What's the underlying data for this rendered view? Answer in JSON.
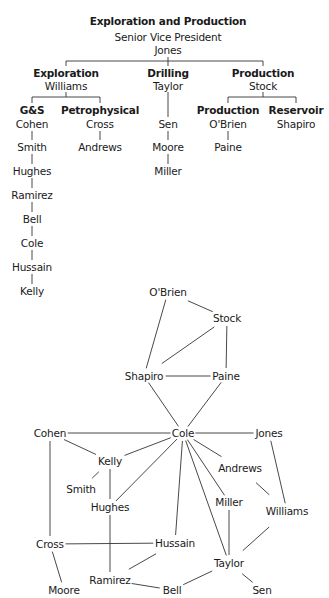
{
  "org_chart": {
    "title": "Exploration and Production",
    "subtitle": "Senior Vice President",
    "head": "Jones",
    "divisions": [
      {
        "name": "Exploration",
        "leader": "Williams",
        "units": [
          {
            "name": "G&S",
            "leader": "Cohen",
            "members": [
              "Smith",
              "Hughes",
              "Ramirez",
              "Bell",
              "Cole",
              "Hussain",
              "Kelly"
            ]
          },
          {
            "name": "Petrophysical",
            "leader": "Cross",
            "members": [
              "Andrews"
            ]
          }
        ]
      },
      {
        "name": "Drilling",
        "leader": "Taylor",
        "units": [],
        "members": [
          "Sen",
          "Moore",
          "Miller"
        ]
      },
      {
        "name": "Production",
        "leader": "Stock",
        "units": [
          {
            "name": "Production",
            "leader": "O'Brien",
            "members": [
              "Paine"
            ]
          },
          {
            "name": "Reservoir",
            "leader": "Shapiro",
            "members": []
          }
        ]
      }
    ]
  },
  "labels": [
    {
      "t": "Exploration and Production",
      "x": 168,
      "y": 21,
      "b": true
    },
    {
      "t": "Senior Vice President",
      "x": 168,
      "y": 37
    },
    {
      "t": "Jones",
      "x": 168,
      "y": 50
    },
    {
      "t": "Exploration",
      "x": 66,
      "y": 73,
      "b": true
    },
    {
      "t": "Williams",
      "x": 66,
      "y": 86
    },
    {
      "t": "Drilling",
      "x": 168,
      "y": 73,
      "b": true
    },
    {
      "t": "Taylor",
      "x": 168,
      "y": 86
    },
    {
      "t": "Production",
      "x": 263,
      "y": 73,
      "b": true
    },
    {
      "t": "Stock",
      "x": 263,
      "y": 86
    },
    {
      "t": "G&S",
      "x": 32,
      "y": 110,
      "b": true
    },
    {
      "t": "Cohen",
      "x": 32,
      "y": 124
    },
    {
      "t": "Smith",
      "x": 32,
      "y": 147
    },
    {
      "t": "Hughes",
      "x": 32,
      "y": 171
    },
    {
      "t": "Ramirez",
      "x": 32,
      "y": 195
    },
    {
      "t": "Bell",
      "x": 32,
      "y": 219
    },
    {
      "t": "Cole",
      "x": 32,
      "y": 243
    },
    {
      "t": "Hussain",
      "x": 32,
      "y": 267
    },
    {
      "t": "Kelly",
      "x": 32,
      "y": 291
    },
    {
      "t": "Petrophysical",
      "x": 100,
      "y": 110,
      "b": true
    },
    {
      "t": "Cross",
      "x": 100,
      "y": 124
    },
    {
      "t": "Andrews",
      "x": 100,
      "y": 147
    },
    {
      "t": "Sen",
      "x": 168,
      "y": 124
    },
    {
      "t": "Moore",
      "x": 168,
      "y": 147
    },
    {
      "t": "Miller",
      "x": 168,
      "y": 171
    },
    {
      "t": "Production",
      "x": 228,
      "y": 110,
      "b": true
    },
    {
      "t": "O'Brien",
      "x": 228,
      "y": 124
    },
    {
      "t": "Paine",
      "x": 228,
      "y": 147
    },
    {
      "t": "Reservoir",
      "x": 296,
      "y": 110,
      "b": true
    },
    {
      "t": "Shapiro",
      "x": 296,
      "y": 124
    }
  ],
  "tree_lines": [
    [
      66,
      61,
      263,
      61
    ],
    [
      168,
      57,
      168,
      66
    ],
    [
      66,
      61,
      66,
      66
    ],
    [
      263,
      61,
      263,
      66
    ],
    [
      32,
      97,
      100,
      97
    ],
    [
      66,
      92,
      66,
      97
    ],
    [
      32,
      97,
      32,
      103
    ],
    [
      100,
      97,
      100,
      103
    ],
    [
      168,
      92,
      168,
      117
    ],
    [
      228,
      97,
      296,
      97
    ],
    [
      263,
      92,
      263,
      97
    ],
    [
      228,
      97,
      228,
      103
    ],
    [
      296,
      97,
      296,
      103
    ],
    [
      32,
      131,
      32,
      140
    ],
    [
      32,
      154,
      32,
      164
    ],
    [
      32,
      178,
      32,
      188
    ],
    [
      32,
      202,
      32,
      212
    ],
    [
      32,
      226,
      32,
      236
    ],
    [
      32,
      250,
      32,
      260
    ],
    [
      32,
      274,
      32,
      284
    ],
    [
      100,
      131,
      100,
      140
    ],
    [
      168,
      131,
      168,
      140
    ],
    [
      168,
      154,
      168,
      164
    ],
    [
      228,
      131,
      228,
      140
    ]
  ],
  "network": {
    "nodes": [
      {
        "id": "O'Brien",
        "x": 168,
        "y": 292
      },
      {
        "id": "Stock",
        "x": 227,
        "y": 318
      },
      {
        "id": "Shapiro",
        "x": 144,
        "y": 376
      },
      {
        "id": "Paine",
        "x": 226,
        "y": 376
      },
      {
        "id": "Cohen",
        "x": 50,
        "y": 433
      },
      {
        "id": "Cole",
        "x": 183,
        "y": 433
      },
      {
        "id": "Jones",
        "x": 269,
        "y": 433
      },
      {
        "id": "Kelly",
        "x": 110,
        "y": 461
      },
      {
        "id": "Andrews",
        "x": 240,
        "y": 468
      },
      {
        "id": "Smith",
        "x": 81,
        "y": 489
      },
      {
        "id": "Hughes",
        "x": 110,
        "y": 507
      },
      {
        "id": "Miller",
        "x": 229,
        "y": 502
      },
      {
        "id": "Williams",
        "x": 287,
        "y": 511
      },
      {
        "id": "Cross",
        "x": 50,
        "y": 544
      },
      {
        "id": "Hussain",
        "x": 175,
        "y": 543
      },
      {
        "id": "Taylor",
        "x": 229,
        "y": 563
      },
      {
        "id": "Ramirez",
        "x": 110,
        "y": 580
      },
      {
        "id": "Moore",
        "x": 64,
        "y": 590
      },
      {
        "id": "Bell",
        "x": 172,
        "y": 590
      },
      {
        "id": "Sen",
        "x": 262,
        "y": 590
      }
    ],
    "edges": [
      [
        "O'Brien",
        "Stock"
      ],
      [
        "O'Brien",
        "Shapiro"
      ],
      [
        "Stock",
        "Shapiro"
      ],
      [
        "Stock",
        "Paine"
      ],
      [
        "Shapiro",
        "Paine"
      ],
      [
        "Shapiro",
        "Cole"
      ],
      [
        "Paine",
        "Cole"
      ],
      [
        "Cohen",
        "Cole"
      ],
      [
        "Cole",
        "Jones"
      ],
      [
        "Cohen",
        "Kelly"
      ],
      [
        "Cohen",
        "Cross"
      ],
      [
        "Kelly",
        "Cole"
      ],
      [
        "Kelly",
        "Smith"
      ],
      [
        "Kelly",
        "Hughes"
      ],
      [
        "Hughes",
        "Cole"
      ],
      [
        "Cole",
        "Andrews"
      ],
      [
        "Cole",
        "Miller"
      ],
      [
        "Cole",
        "Hussain"
      ],
      [
        "Cole",
        "Taylor"
      ],
      [
        "Jones",
        "Williams"
      ],
      [
        "Andrews",
        "Williams"
      ],
      [
        "Miller",
        "Taylor"
      ],
      [
        "Williams",
        "Taylor"
      ],
      [
        "Cross",
        "Hussain"
      ],
      [
        "Cross",
        "Moore"
      ],
      [
        "Hughes",
        "Ramirez"
      ],
      [
        "Hussain",
        "Ramirez"
      ],
      [
        "Ramirez",
        "Bell"
      ],
      [
        "Bell",
        "Taylor"
      ],
      [
        "Taylor",
        "Sen"
      ]
    ]
  }
}
